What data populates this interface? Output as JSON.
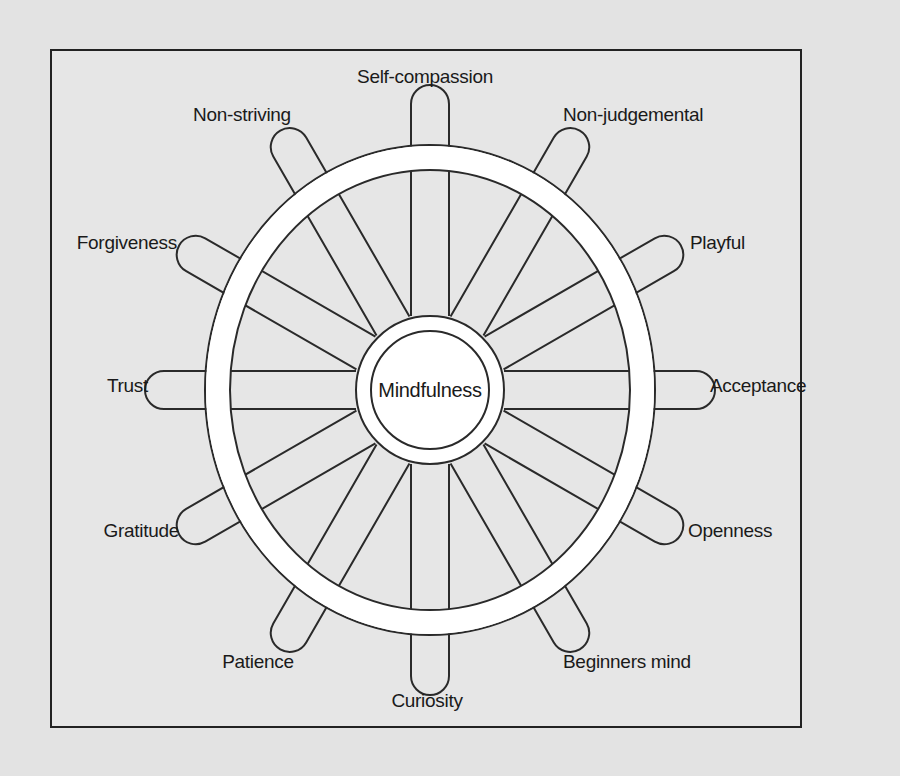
{
  "diagram": {
    "type": "wheel",
    "center_label": "Mindfulness",
    "spokes": [
      {
        "label": "Acceptance",
        "angle": 0
      },
      {
        "label": "Openness",
        "angle": 30
      },
      {
        "label": "Beginners mind",
        "angle": 60
      },
      {
        "label": "Curiosity",
        "angle": 90
      },
      {
        "label": "Patience",
        "angle": 120
      },
      {
        "label": "Gratitude",
        "angle": 150
      },
      {
        "label": "Trust",
        "angle": 180
      },
      {
        "label": "Forgiveness",
        "angle": 210
      },
      {
        "label": "Non-striving",
        "angle": 240
      },
      {
        "label": "Self-compassion",
        "angle": 270
      },
      {
        "label": "Non-judgemental",
        "angle": 300
      },
      {
        "label": "Playful",
        "angle": 330
      }
    ],
    "colors": {
      "background": "#e3e3e3",
      "panel": "#e6e6e6",
      "line": "#2a2a2a",
      "fill": "#ffffff"
    }
  }
}
